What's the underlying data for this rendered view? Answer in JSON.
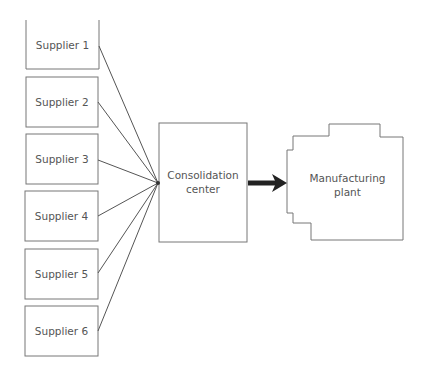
{
  "diagram": {
    "suppliers": [
      {
        "label": "Supplier 1"
      },
      {
        "label": "Supplier 2"
      },
      {
        "label": "Supplier 3"
      },
      {
        "label": "Supplier 4"
      },
      {
        "label": "Supplier 5"
      },
      {
        "label": "Supplier 6"
      }
    ],
    "consolidation": {
      "line1": "Consolidation",
      "line2": "center"
    },
    "plant": {
      "line1": "Manufacturing",
      "line2": "plant"
    },
    "colors": {
      "stroke": "#777777",
      "arrow": "#222222",
      "text": "#555555"
    }
  }
}
